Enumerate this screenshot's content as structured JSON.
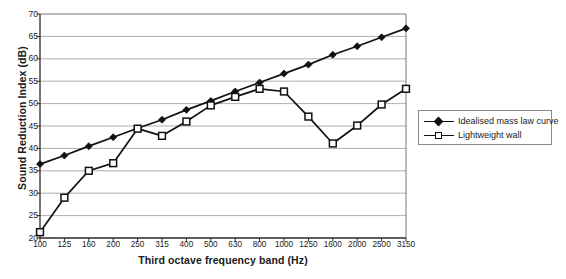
{
  "chart_data": {
    "type": "line",
    "title": "",
    "xlabel": "Third octave frequency band (Hz)",
    "ylabel": "Sound Reduction Index (dB)",
    "categories": [
      "100",
      "125",
      "160",
      "200",
      "250",
      "315",
      "400",
      "500",
      "630",
      "800",
      "1000",
      "1250",
      "1600",
      "2000",
      "2500",
      "3150"
    ],
    "ylim": [
      20,
      70
    ],
    "yticks": [
      20,
      25,
      30,
      35,
      40,
      45,
      50,
      55,
      60,
      65,
      70
    ],
    "grid": "horizontal",
    "legend_position": "right",
    "series": [
      {
        "name": "Idealised mass law curve",
        "marker": "filled-diamond",
        "color": "#111111",
        "values": [
          36.5,
          38.4,
          40.5,
          42.5,
          44.5,
          46.4,
          48.6,
          50.6,
          52.7,
          54.7,
          56.7,
          58.7,
          60.9,
          62.8,
          64.8,
          66.8
        ]
      },
      {
        "name": "Lightweight wall",
        "marker": "open-square",
        "color": "#111111",
        "values": [
          21.3,
          29.0,
          35.0,
          36.7,
          44.4,
          42.8,
          46.0,
          49.6,
          51.5,
          53.3,
          52.7,
          47.1,
          41.1,
          45.1,
          49.8,
          53.3
        ]
      }
    ]
  },
  "legend": {
    "items": [
      {
        "label": "Idealised mass law curve"
      },
      {
        "label": "Lightweight wall"
      }
    ]
  }
}
